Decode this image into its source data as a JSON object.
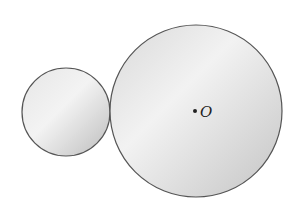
{
  "diagram": {
    "small_circle": {
      "cx": 66,
      "cy": 112,
      "r": 44
    },
    "large_circle": {
      "cx": 196,
      "cy": 111,
      "r": 86
    },
    "center_point": {
      "x": 196,
      "y": 111,
      "label": "O"
    },
    "colors": {
      "stroke": "#555555",
      "fill_light": "#f2f2f2",
      "fill_dark": "#c8c8c8",
      "point": "#222222"
    }
  }
}
